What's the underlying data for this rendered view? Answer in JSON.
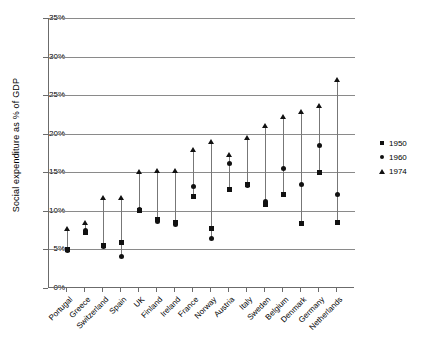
{
  "chart_data": {
    "type": "scatter",
    "title": "",
    "xlabel": "",
    "ylabel": "Social expenditure as % of GDP",
    "ylim": [
      0,
      35
    ],
    "ytick_labels": [
      "0%",
      "5%",
      "10%",
      "15%",
      "20%",
      "25%",
      "30%",
      "35%"
    ],
    "ytick_values": [
      0,
      5,
      10,
      15,
      20,
      25,
      30,
      35
    ],
    "grid": true,
    "legend_position": "right",
    "categories": [
      "Portugal",
      "Greece",
      "Switzerland",
      "Spain",
      "UK",
      "Finland",
      "Ireland",
      "France",
      "Norway",
      "Austria",
      "Italy",
      "Sweden",
      "Belgium",
      "Denmark",
      "Germany",
      "Netherlands"
    ],
    "series": [
      {
        "name": "1950",
        "marker": "square",
        "values": [
          5.0,
          7.2,
          5.5,
          5.9,
          10.0,
          8.9,
          8.5,
          11.9,
          7.7,
          12.8,
          13.4,
          10.8,
          12.1,
          8.4,
          15.0,
          8.5
        ]
      },
      {
        "name": "1960",
        "marker": "circle",
        "values": [
          4.9,
          7.4,
          5.4,
          4.1,
          10.2,
          8.6,
          8.3,
          13.1,
          6.4,
          16.1,
          13.3,
          11.2,
          15.5,
          13.4,
          18.5,
          12.1
        ]
      },
      {
        "name": "1974",
        "marker": "triangle",
        "values": [
          7.6,
          8.4,
          11.7,
          11.7,
          15.0,
          15.2,
          15.2,
          17.9,
          18.9,
          17.3,
          19.4,
          21.0,
          22.2,
          22.8,
          23.6,
          27.0
        ]
      }
    ]
  },
  "legend": {
    "items": [
      {
        "label": "1950",
        "marker": "square"
      },
      {
        "label": "1960",
        "marker": "circle"
      },
      {
        "label": "1974",
        "marker": "triangle"
      }
    ]
  },
  "colors": {
    "marker": "#111111",
    "gridline": "#8a8a8a",
    "axis": "#6b6b6b",
    "connector": "#777777",
    "background": "#ffffff"
  }
}
